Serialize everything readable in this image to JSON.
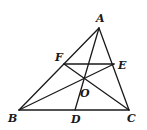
{
  "figure": {
    "width": 147,
    "height": 130,
    "stroke_color": "#1a1a1a",
    "background": "#ffffff",
    "points": {
      "A": {
        "label": "A",
        "x": 99,
        "y": 28,
        "lx": 96,
        "ly": 22
      },
      "B": {
        "label": "B",
        "x": 19,
        "y": 110,
        "lx": 8,
        "ly": 122
      },
      "C": {
        "label": "C",
        "x": 129,
        "y": 110,
        "lx": 127,
        "ly": 122
      },
      "D": {
        "label": "D",
        "x": 75,
        "y": 110,
        "lx": 71,
        "ly": 123
      },
      "E": {
        "label": "E",
        "x": 114,
        "y": 64,
        "lx": 118,
        "ly": 69
      },
      "F": {
        "label": "F",
        "x": 64,
        "y": 64,
        "lx": 55,
        "ly": 61
      },
      "O": {
        "label": "O",
        "x": 84,
        "y": 78,
        "lx": 80,
        "ly": 97
      }
    },
    "segments": [
      {
        "name": "AB",
        "from": "A",
        "to": "B"
      },
      {
        "name": "AC",
        "from": "A",
        "to": "C"
      },
      {
        "name": "BC",
        "from": "B",
        "to": "C"
      },
      {
        "name": "AD",
        "from": "A",
        "to": "D"
      },
      {
        "name": "FE",
        "from": "F",
        "to": "E"
      },
      {
        "name": "BE",
        "from": "B",
        "to": "E"
      },
      {
        "name": "CF",
        "from": "C",
        "to": "F"
      }
    ]
  }
}
